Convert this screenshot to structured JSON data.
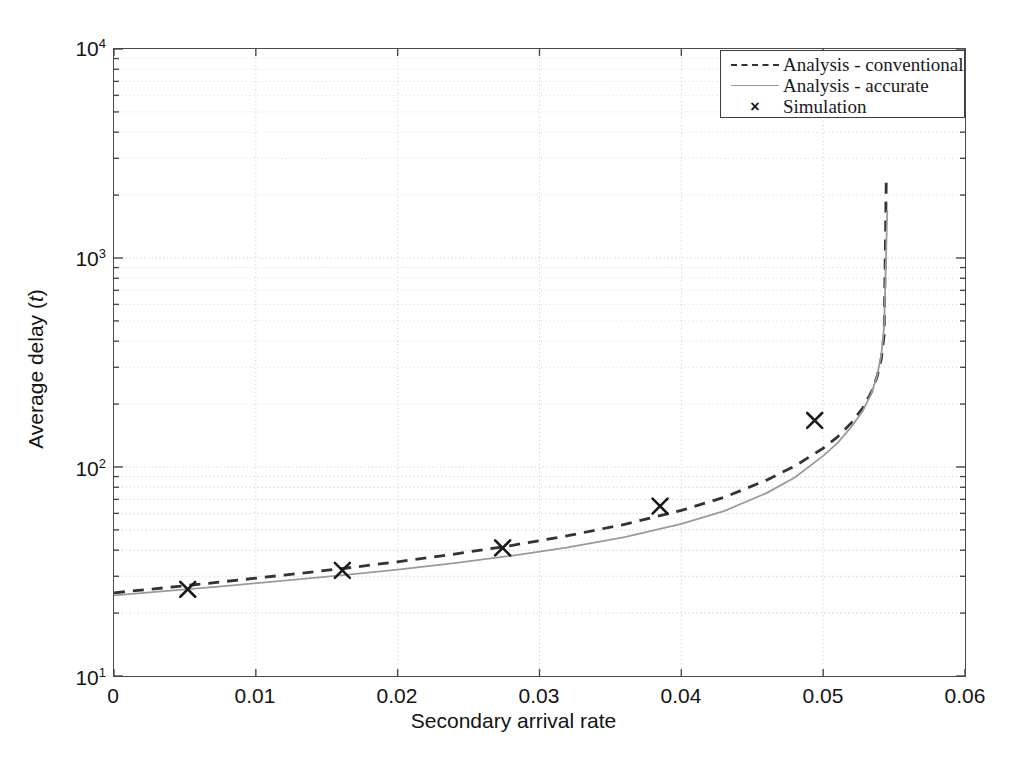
{
  "figure": {
    "background": "#ffffff",
    "frame_color": "#4a4a4a"
  },
  "axis": {
    "xlabel": "Secondary arrival rate",
    "ylabel_prefix": "Average delay (",
    "ylabel_var": "t",
    "ylabel_suffix": ")",
    "xticks": [
      "0",
      "0.01",
      "0.02",
      "0.03",
      "0.04",
      "0.05",
      "0.06"
    ],
    "yticks": [
      "10",
      "10",
      "10",
      "10"
    ],
    "yexp": [
      "1",
      "2",
      "3",
      "4"
    ]
  },
  "legend": {
    "items": [
      {
        "label": "Analysis - conventional",
        "key": "dashed-line-key",
        "color": "#333333"
      },
      {
        "label": "Analysis - accurate",
        "key": "solid-line-key",
        "color": "#9a9a9a"
      },
      {
        "label": "Simulation",
        "key": "cross-marker-key",
        "marker": "×",
        "color": "#1a1a1a"
      }
    ]
  },
  "chart_data": {
    "type": "line",
    "title": "",
    "xlabel": "Secondary arrival rate",
    "ylabel": "Average delay (t)",
    "xlim": [
      0,
      0.06
    ],
    "ylim": [
      10,
      10000
    ],
    "yscale": "log",
    "xscale": "linear",
    "grid": true,
    "grid_style": "dotted",
    "grid_color": "#cfcfcf",
    "legend_position": "top-right",
    "xticks": [
      0,
      0.01,
      0.02,
      0.03,
      0.04,
      0.05,
      0.06
    ],
    "yticks": [
      10,
      100,
      1000,
      10000
    ],
    "series": [
      {
        "name": "Analysis - conventional",
        "style": "dashed",
        "color": "#333333",
        "x": [
          0,
          0.004,
          0.008,
          0.012,
          0.016,
          0.02,
          0.024,
          0.028,
          0.032,
          0.036,
          0.04,
          0.043,
          0.046,
          0.048,
          0.05,
          0.051,
          0.052,
          0.0528,
          0.0534,
          0.0538,
          0.0541,
          0.0543,
          0.05445
        ],
        "y": [
          25.0,
          26.6,
          28.4,
          30.4,
          32.6,
          35.2,
          38.3,
          42.1,
          46.9,
          53.2,
          62.0,
          71.5,
          86.5,
          101.0,
          123.0,
          139.0,
          163.0,
          192.0,
          228.0,
          270.0,
          330.0,
          430.0,
          2400.0
        ]
      },
      {
        "name": "Analysis - accurate",
        "style": "solid",
        "color": "#9a9a9a",
        "x": [
          0,
          0.004,
          0.008,
          0.012,
          0.016,
          0.02,
          0.024,
          0.028,
          0.032,
          0.036,
          0.04,
          0.043,
          0.046,
          0.048,
          0.05,
          0.051,
          0.052,
          0.0528,
          0.0534,
          0.0538,
          0.0541,
          0.0543,
          0.05452
        ],
        "y": [
          24.3,
          25.6,
          27.0,
          28.6,
          30.3,
          32.3,
          34.7,
          37.6,
          41.3,
          46.2,
          53.5,
          61.5,
          75.0,
          89.0,
          113.0,
          130.0,
          156.0,
          186.0,
          225.0,
          272.0,
          345.0,
          470.0,
          1700.0
        ]
      },
      {
        "name": "Simulation",
        "style": "marker",
        "marker": "x",
        "color": "#1a1a1a",
        "x": [
          0.0052,
          0.0161,
          0.0274,
          0.0385,
          0.0494
        ],
        "y": [
          26.0,
          32.0,
          41.0,
          65.0,
          167.0
        ]
      }
    ]
  }
}
